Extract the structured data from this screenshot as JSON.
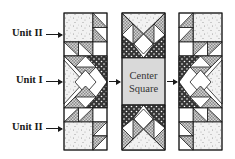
{
  "labels": {
    "unit_top": "Unit II",
    "unit_middle": "Unit I",
    "unit_bottom": "Unit II",
    "center_line1": "Center",
    "center_line2": "Square"
  },
  "colors": {
    "outline": "#1a1a1a",
    "light_fabric": "#f4f4f4",
    "medium_fabric": "#c8c8c8",
    "dark_fabric": "#3a3a3a",
    "center_fill": "#d9d9d9"
  }
}
